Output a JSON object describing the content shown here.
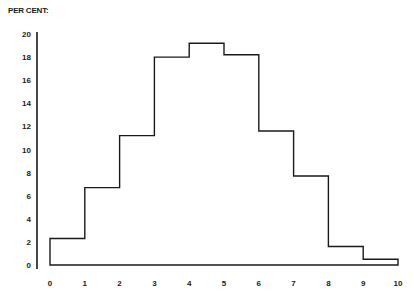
{
  "chart_data": {
    "type": "bar",
    "subtype": "histogram",
    "title": "",
    "xlabel": "",
    "ylabel": "PER CENT:",
    "x_bin_edges": [
      0,
      1,
      2,
      3,
      4,
      5,
      6,
      7,
      8,
      9,
      10
    ],
    "categories": [
      "0-1",
      "1-2",
      "2-3",
      "3-4",
      "4-5",
      "5-6",
      "6-7",
      "7-8",
      "8-9",
      "9-10"
    ],
    "values": [
      2.3,
      6.7,
      11.2,
      18.0,
      19.2,
      18.2,
      11.6,
      7.7,
      1.6,
      0.5
    ],
    "xticks": [
      "0",
      "1",
      "2",
      "3",
      "4",
      "5",
      "6",
      "7",
      "8",
      "9",
      "10"
    ],
    "yticks": [
      "0",
      "2",
      "4",
      "6",
      "8",
      "10",
      "12",
      "14",
      "16",
      "18",
      "20"
    ],
    "xlim": [
      0,
      10
    ],
    "ylim": [
      0,
      20
    ],
    "grid": false,
    "legend": null
  },
  "colors": {
    "line": "#1a1a1a",
    "background": "#ffffff"
  }
}
